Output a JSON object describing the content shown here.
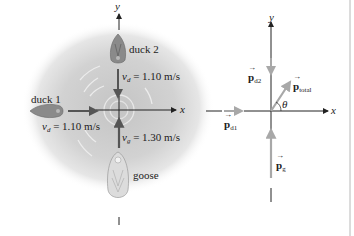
{
  "left_diagram": {
    "axes": {
      "x_label": "x",
      "y_label": "y"
    },
    "duck2": {
      "label": "duck 2",
      "velocity_symbol": "v",
      "velocity_sub": "d",
      "velocity_value": "= 1.10 m/s",
      "direction": "down"
    },
    "duck1": {
      "label": "duck 1",
      "velocity_symbol": "v",
      "velocity_sub": "d",
      "velocity_value": "= 1.10 m/s",
      "direction": "right"
    },
    "goose": {
      "label": "goose",
      "velocity_symbol": "v",
      "velocity_sub": "g",
      "velocity_value": "= 1.30 m/s",
      "direction": "up"
    }
  },
  "right_diagram": {
    "axes": {
      "x_label": "x",
      "y_label": "y"
    },
    "vectors": {
      "p_d2": {
        "symbol": "p",
        "sub": "d2"
      },
      "p_d1": {
        "symbol": "p",
        "sub": "d1"
      },
      "p_g": {
        "symbol": "p",
        "sub": "g"
      },
      "p_total": {
        "symbol": "p",
        "sub": "total"
      }
    },
    "angle_label": "θ"
  },
  "colors": {
    "axis": "#222222",
    "velocity_arrow": "#555555",
    "momentum_arrow": "#a8a8a8",
    "water_shadow": "#c8c8c8",
    "border_line": "#b8b8b8"
  }
}
